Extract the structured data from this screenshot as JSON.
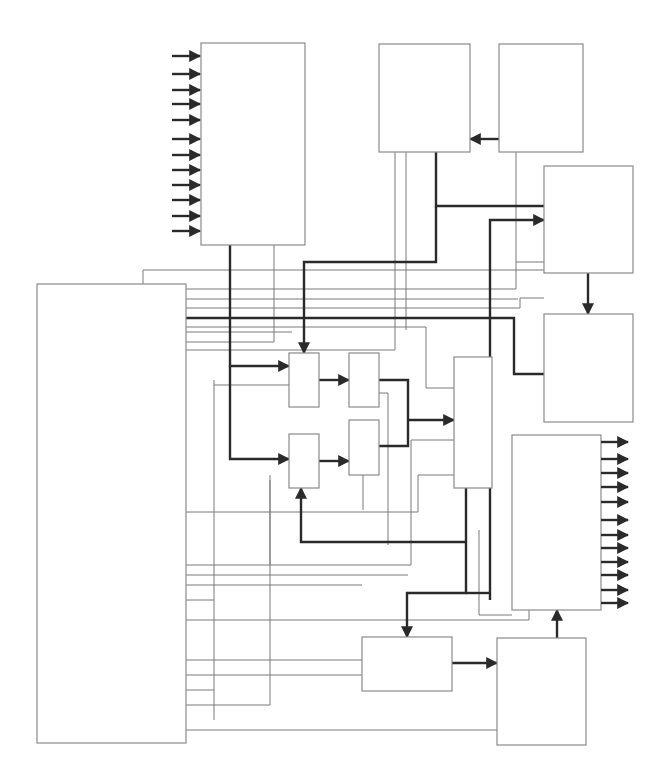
{
  "diagram": {
    "type": "block-diagram",
    "caption": "",
    "colors": {
      "block_stroke": "#8a8a8a",
      "thin_wire": "#7a7a7a",
      "thick_wire": "#2a2a2a",
      "background": "#ffffff"
    },
    "blocks": [
      {
        "id": "input-block",
        "x": 201,
        "y": 43,
        "w": 104,
        "h": 202,
        "label": ""
      },
      {
        "id": "top-middle-block",
        "x": 379,
        "y": 44,
        "w": 91,
        "h": 108,
        "label": ""
      },
      {
        "id": "top-right-block",
        "x": 499,
        "y": 44,
        "w": 84,
        "h": 108,
        "label": ""
      },
      {
        "id": "right-upper-block",
        "x": 544,
        "y": 166,
        "w": 89,
        "h": 107,
        "label": ""
      },
      {
        "id": "right-middle-block",
        "x": 544,
        "y": 314,
        "w": 89,
        "h": 108,
        "label": ""
      },
      {
        "id": "main-left-block",
        "x": 37,
        "y": 284,
        "w": 149,
        "h": 459,
        "label": ""
      },
      {
        "id": "stage1-top-block",
        "x": 289,
        "y": 353,
        "w": 30,
        "h": 54,
        "label": ""
      },
      {
        "id": "stage1-bottom-block",
        "x": 289,
        "y": 434,
        "w": 30,
        "h": 54,
        "label": ""
      },
      {
        "id": "stage2-top-block",
        "x": 349,
        "y": 353,
        "w": 30,
        "h": 54,
        "label": ""
      },
      {
        "id": "stage2-bottom-block",
        "x": 349,
        "y": 420,
        "w": 30,
        "h": 55,
        "label": ""
      },
      {
        "id": "combiner-block",
        "x": 454,
        "y": 357,
        "w": 38,
        "h": 131,
        "label": ""
      },
      {
        "id": "output-block",
        "x": 512,
        "y": 435,
        "w": 89,
        "h": 175,
        "label": ""
      },
      {
        "id": "bottom-middle-block",
        "x": 362,
        "y": 637,
        "w": 90,
        "h": 54,
        "label": ""
      },
      {
        "id": "bottom-right-block",
        "x": 497,
        "y": 638,
        "w": 89,
        "h": 107,
        "label": ""
      }
    ],
    "input_arrows": {
      "count": 12,
      "x1": 172,
      "x2": 201,
      "ys": [
        56,
        74,
        90,
        104,
        120,
        139,
        155,
        170,
        185,
        200,
        216,
        231
      ]
    },
    "output_arrows": {
      "count": 12,
      "x1": 601,
      "x2": 628,
      "ys": [
        442,
        459,
        473,
        487,
        502,
        520,
        535,
        548,
        562,
        575,
        590,
        603
      ]
    },
    "thick_paths": [
      {
        "d": "M230 245 V366 H289",
        "arrow_end": true
      },
      {
        "d": "M230 366 V459 H289",
        "arrow_end": true
      },
      {
        "d": "M319 380 H349",
        "arrow_end": true
      },
      {
        "d": "M319 461 H349",
        "arrow_end": true
      },
      {
        "d": "M379 380 H408 V446 H379",
        "arrow_end": false
      },
      {
        "d": "M408 420 H454",
        "arrow_end": true
      },
      {
        "d": "M436 152 V206 H544",
        "arrow_end": false
      },
      {
        "d": "M304 353 V262 H436 V206",
        "arrow_end": true,
        "arrow_at": "start-down"
      },
      {
        "d": "M490 600 V220 H544",
        "arrow_end": true
      },
      {
        "d": "M499 139 H470",
        "arrow_end": true
      },
      {
        "d": "M588 273 V314",
        "arrow_end": true
      },
      {
        "d": "M186 318 H514 V374 H544",
        "arrow_end": false
      },
      {
        "d": "M466 488 V593 H407 V637",
        "arrow_end": true
      },
      {
        "d": "M490 593 H466",
        "arrow_end": false
      },
      {
        "d": "M466 542 H301 V488",
        "arrow_end": true
      },
      {
        "d": "M452 663 H497",
        "arrow_end": true
      },
      {
        "d": "M557 638 V610",
        "arrow_end": true
      }
    ],
    "thin_paths": [
      "M143 284 V270 H544",
      "M186 289 H516 V262 H544",
      "M186 299 H518",
      "M186 308 H520 V298 H544",
      "M186 327 H426 V342",
      "M186 332 H292",
      "M186 342 H274 V245",
      "M186 350 H395 V152",
      "M406 152 V330",
      "M516 152 V262",
      "M426 342 V388 H454",
      "M214 385 H289",
      "M214 380 V720",
      "M186 600 H214",
      "M379 393 H388 V545",
      "M270 475 V565",
      "M363 475 V510",
      "M186 512 H418 V475 H454",
      "M186 565 H411 V440 H454",
      "M186 575 H408",
      "M186 585 H362",
      "M186 620 H529 V610",
      "M186 660 H362",
      "M186 675 H362",
      "M186 690 H214",
      "M186 705 H270 V480",
      "M186 730 H497",
      "M479 530 V615 H512"
    ]
  }
}
